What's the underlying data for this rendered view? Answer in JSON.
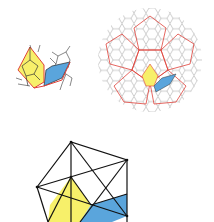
{
  "figure": {
    "panels": [
      {
        "id": "local-patch",
        "description": "Small patch of pentagonal tiling with highlighted yellow and blue tiles outlined in red"
      },
      {
        "id": "global-tiling",
        "description": "Circular region of pentagonal/hexagonal tiling (gray) with red superimposed larger pentagon tiling and yellow/blue highlighted tiles"
      },
      {
        "id": "polyhedron-projection",
        "description": "Black wireframe projection with yellow and blue shaded faces"
      }
    ],
    "colors": {
      "yellow": "#f7f06a",
      "blue": "#5aa5dc",
      "red": "#e0413a",
      "gray": "#8a8a8a",
      "black": "#111111"
    }
  }
}
